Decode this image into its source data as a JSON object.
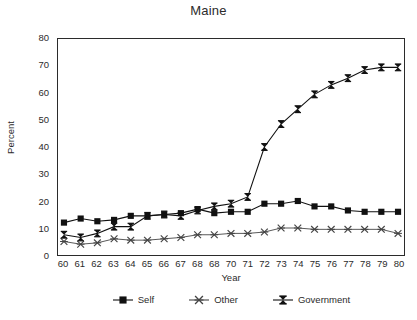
{
  "chart_data": {
    "type": "line",
    "title": "Maine",
    "xlabel": "Year",
    "ylabel": "Percent",
    "grid": false,
    "legend_position": "bottom",
    "xlim": [
      60,
      80
    ],
    "ylim": [
      0,
      80
    ],
    "x": [
      60,
      61,
      62,
      63,
      64,
      65,
      66,
      67,
      68,
      69,
      70,
      71,
      72,
      73,
      74,
      75,
      76,
      77,
      78,
      79,
      80
    ],
    "categories": [
      "60",
      "61",
      "62",
      "63",
      "64",
      "65",
      "66",
      "67",
      "68",
      "68",
      "70",
      "71",
      "72",
      "73",
      "74",
      "75",
      "76",
      "77",
      "78",
      "79",
      "80"
    ],
    "y_ticks": [
      0,
      10,
      20,
      30,
      40,
      50,
      60,
      70,
      80
    ],
    "series": [
      {
        "name": "Self",
        "marker": "filled-square",
        "color": "#111111",
        "values": [
          12,
          13.5,
          12.5,
          13,
          14.5,
          14.5,
          15,
          15.5,
          17,
          15.5,
          16,
          16,
          19,
          19,
          20,
          18,
          18,
          16.5,
          16,
          16,
          16
        ]
      },
      {
        "name": "Other",
        "marker": "x-cross",
        "color": "#444444",
        "values": [
          5,
          4,
          4.5,
          6,
          5.5,
          5.5,
          6,
          6.5,
          7.5,
          7.5,
          8,
          8,
          8.5,
          10,
          10,
          9.5,
          9.5,
          9.5,
          9.5,
          9.5,
          8
        ]
      },
      {
        "name": "Government",
        "marker": "bowtie",
        "color": "#111111",
        "values": [
          7.5,
          6.5,
          8,
          10.5,
          10.5,
          14.5,
          15,
          14.5,
          16.5,
          18,
          19,
          21.5,
          40,
          48.5,
          54,
          59.5,
          63,
          65.5,
          68.5,
          69.5,
          69.5
        ]
      }
    ]
  },
  "legend": {
    "items": [
      {
        "label": "Self",
        "marker": "filled-square"
      },
      {
        "label": "Other",
        "marker": "x-cross"
      },
      {
        "label": "Government",
        "marker": "bowtie"
      }
    ]
  }
}
